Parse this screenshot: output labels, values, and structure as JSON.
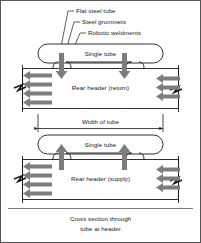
{
  "figure": {
    "caption_line1": "Cross section through",
    "caption_line2": "tube at header",
    "border_color": "#555555",
    "line_color": "#1a1a1a",
    "arrow_fill": "#7d7d7d"
  },
  "callouts": [
    {
      "name": "flat-steel-tube",
      "text": "Flat steel tube"
    },
    {
      "name": "steel-grommets",
      "text": "Steel grommets"
    },
    {
      "name": "robotic-weldments",
      "text": "Robotic weldments"
    }
  ],
  "upper": {
    "tube_label": "Single tube",
    "header_label": "Rear header (return)",
    "flow_direction": "down",
    "left_arrow_count": 4,
    "right_arrow_count": 3
  },
  "dimension": {
    "label": "Width of tube"
  },
  "lower": {
    "tube_label": "Single tube",
    "header_label": "Rear header (supply)",
    "flow_direction": "up",
    "left_arrow_count": 4,
    "right_arrow_count": 3
  }
}
